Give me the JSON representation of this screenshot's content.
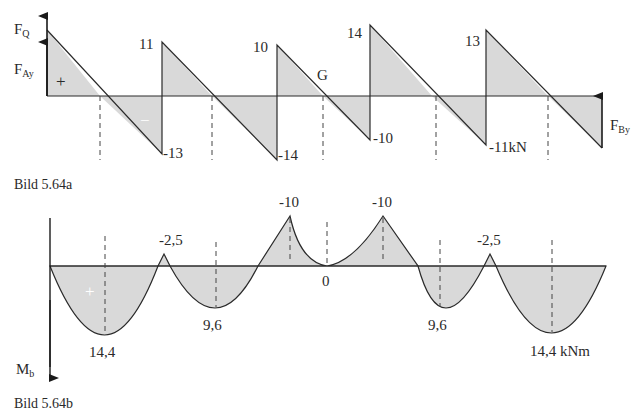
{
  "figure_a": {
    "caption": "Bild 5.64a",
    "axis_label": "F",
    "axis_label_sub": "Q",
    "support_a_label": "F",
    "support_a_sub": "Ay",
    "support_b_label": "F",
    "support_b_sub": "By",
    "sign_positive": "+",
    "sign_negative": "−",
    "hinge_label": "G",
    "values": [
      {
        "id": "v11",
        "text": "11"
      },
      {
        "id": "vm13",
        "text": "-13"
      },
      {
        "id": "v10",
        "text": "10"
      },
      {
        "id": "vm14",
        "text": "-14"
      },
      {
        "id": "v14",
        "text": "14"
      },
      {
        "id": "vm10",
        "text": "-10"
      },
      {
        "id": "v13",
        "text": "13"
      },
      {
        "id": "vm11",
        "text": "-11kN"
      }
    ]
  },
  "figure_b": {
    "caption": "Bild 5.64b",
    "axis_label": "M",
    "axis_label_sub": "b",
    "sign_positive": "+",
    "values": [
      {
        "id": "m1",
        "text": "14,4"
      },
      {
        "id": "m2",
        "text": "-2,5"
      },
      {
        "id": "m3",
        "text": "9,6"
      },
      {
        "id": "m4",
        "text": "-10"
      },
      {
        "id": "m5",
        "text": "0"
      },
      {
        "id": "m6",
        "text": "-10"
      },
      {
        "id": "m7",
        "text": "9,6"
      },
      {
        "id": "m8",
        "text": "-2,5"
      },
      {
        "id": "m9",
        "text": "14,4 kNm"
      }
    ]
  },
  "colors": {
    "line": "#2a2a2a",
    "fill": "#d9d9d9"
  }
}
